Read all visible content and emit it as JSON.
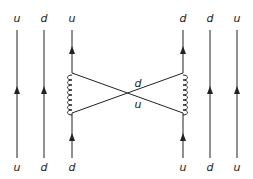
{
  "diagram": {
    "line_color": "#222222",
    "top_labels": [
      "u",
      "d",
      "u",
      "d",
      "d",
      "u"
    ],
    "bottom_labels": [
      "u",
      "d",
      "d",
      "u",
      "d",
      "u"
    ],
    "exchange_labels": {
      "upper": "d",
      "lower": "u"
    },
    "gluons": [
      "left-gluon",
      "right-gluon"
    ]
  }
}
